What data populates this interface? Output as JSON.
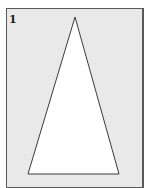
{
  "figure": {
    "label": "1",
    "panel_background": "#e9e9e9",
    "panel_border": "#5a5a5a",
    "shape": {
      "type": "isosceles-triangle",
      "fill": "#ffffff",
      "stroke": "#3a3a3a",
      "points": "75,17 28,174 119,174"
    }
  }
}
